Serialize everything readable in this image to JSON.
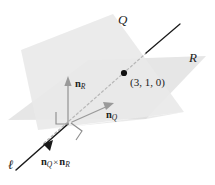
{
  "figure": {
    "background_color": "#ffffff",
    "width": 215,
    "height": 185
  },
  "labels": {
    "plane_q": "Q",
    "plane_r": "R",
    "line_l": "ℓ",
    "point_coords": "(3, 1, 0)",
    "normal_r_name": "n",
    "normal_r_sub": "R",
    "normal_q_name": "n",
    "normal_q_sub": "Q",
    "cross_left_name": "n",
    "cross_left_sub": "Q",
    "cross_symbol": "×",
    "cross_right_name": "n",
    "cross_right_sub": "R"
  },
  "colors": {
    "plane_q_fill": "#ebebeb",
    "plane_r_fill": "#e4e4e4",
    "plane_overlap_fill": "#dedede",
    "line_solid": "#1a1a1a",
    "line_hidden": "#b4b4b4",
    "normal_vector": "#9a9a9a",
    "right_angle": "#9a9a9a",
    "point_dot": "#111111",
    "text": "#222222"
  },
  "geometry": {
    "plane_q_polygon": "112,16 182,112 38,128 22,52",
    "plane_r_polygon": "10,118 86,62 205,58 142,118",
    "line_l_start": [
      14,
      171
    ],
    "line_l_end": [
      178,
      26
    ],
    "point_position": [
      124,
      72
    ],
    "normal_r_tail": [
      68,
      122
    ],
    "normal_r_head": [
      68,
      80
    ],
    "normal_q_tail": [
      80,
      118
    ],
    "normal_q_head": [
      112,
      104
    ]
  },
  "annotations": {
    "right_angle_marker_count": 2,
    "line_style_note": "solid where visible, dashed where occluded by plane"
  }
}
